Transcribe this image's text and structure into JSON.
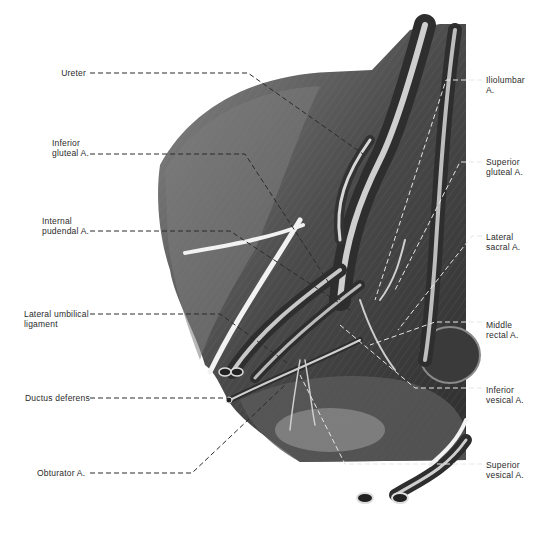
{
  "figure": {
    "colors": {
      "background": "#ffffff",
      "tissue_dark": "#3a3a3a",
      "tissue_mid": "#6e6e6e",
      "tissue_light": "#b5b5b5",
      "vessel_highlight": "#e8e8e8",
      "leader_line": "#2a2a2a",
      "leader_line_on_dark": "#e0e0e0"
    }
  },
  "labels_left": [
    {
      "id": "ureter",
      "lines": [
        "Ureter"
      ]
    },
    {
      "id": "inferior-gluteal",
      "lines": [
        "Inferior",
        "gluteal A."
      ]
    },
    {
      "id": "internal-pudendal",
      "lines": [
        "Internal",
        "pudendal A."
      ]
    },
    {
      "id": "lateral-umbilical",
      "lines": [
        "Lateral umbilical",
        "ligament"
      ]
    },
    {
      "id": "ductus-deferens",
      "lines": [
        "Ductus deferens"
      ]
    },
    {
      "id": "obturator",
      "lines": [
        "Obturator A."
      ]
    }
  ],
  "labels_right": [
    {
      "id": "iliolumbar",
      "lines": [
        "Iliolumbar",
        "A."
      ]
    },
    {
      "id": "superior-gluteal",
      "lines": [
        "Superior",
        "gluteal A."
      ]
    },
    {
      "id": "lateral-sacral",
      "lines": [
        "Lateral",
        "sacral A."
      ]
    },
    {
      "id": "middle-rectal",
      "lines": [
        "Middle",
        "rectal A."
      ]
    },
    {
      "id": "inferior-vesical",
      "lines": [
        "Inferior",
        "vesical A."
      ]
    },
    {
      "id": "superior-vesical",
      "lines": [
        "Superior",
        "vesical A."
      ]
    }
  ]
}
